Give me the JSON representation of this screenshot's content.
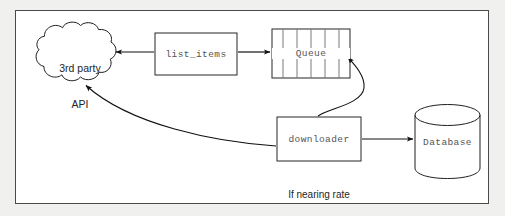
{
  "diagram": {
    "frame": {
      "border_color": "#4a4a4a",
      "background": "#ffffff"
    },
    "page_background": "#f0f0ef",
    "nodes": [
      {
        "id": "third-party-api",
        "shape": "cloud",
        "label_line1": "3rd party",
        "label_line2": "API",
        "font": "sans"
      },
      {
        "id": "list-items",
        "shape": "rectangle",
        "label": "list_items",
        "font": "mono"
      },
      {
        "id": "queue",
        "shape": "queue",
        "label": "Queue",
        "font": "mono",
        "dividers": 5
      },
      {
        "id": "downloader",
        "shape": "rectangle",
        "label": "downloader",
        "font": "mono"
      },
      {
        "id": "database",
        "shape": "cylinder",
        "label": "Database",
        "font": "mono"
      }
    ],
    "captions": [
      {
        "id": "downloader-note",
        "line1": "If nearing rate",
        "line2": "limit, quit"
      }
    ],
    "edges": [
      {
        "id": "list-items-to-api",
        "from": "list_items",
        "to": "3rd party API",
        "style": "straight",
        "arrow": "left"
      },
      {
        "id": "list-items-to-queue",
        "from": "list_items",
        "to": "Queue",
        "style": "straight",
        "arrow": "right"
      },
      {
        "id": "downloader-to-queue",
        "from": "downloader",
        "to": "Queue",
        "style": "s-curve",
        "arrow": "up"
      },
      {
        "id": "downloader-to-api",
        "from": "downloader",
        "to": "3rd party API",
        "style": "long-curve",
        "arrow": "up-left"
      },
      {
        "id": "downloader-to-database",
        "from": "downloader",
        "to": "Database",
        "style": "straight",
        "arrow": "right"
      }
    ]
  }
}
